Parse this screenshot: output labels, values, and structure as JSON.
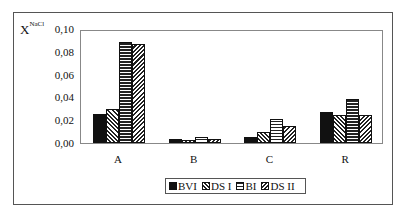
{
  "chart_data": {
    "type": "bar",
    "title": "",
    "xlabel": "",
    "ylabel": "X",
    "ylabel_superscript": "NaCl",
    "ylim": [
      0,
      0.1
    ],
    "yticks": [
      "0,00",
      "0,02",
      "0,04",
      "0,06",
      "0,08",
      "0,10"
    ],
    "grid": false,
    "legend_position": "bottom",
    "categories": [
      "A",
      "B",
      "C",
      "R"
    ],
    "series": [
      {
        "name": "BVI",
        "pattern": "solid-black",
        "values": [
          0.026,
          0.004,
          0.005,
          0.028
        ]
      },
      {
        "name": "DS I",
        "pattern": "diagonal-hatch",
        "values": [
          0.03,
          0.003,
          0.01,
          0.025
        ]
      },
      {
        "name": "BI",
        "pattern": "horizontal-hatch",
        "values": [
          0.09,
          0.005,
          0.021,
          0.039
        ]
      },
      {
        "name": "DS II",
        "pattern": "reverse-diagonal-hatch",
        "values": [
          0.088,
          0.004,
          0.015,
          0.025
        ]
      }
    ]
  }
}
